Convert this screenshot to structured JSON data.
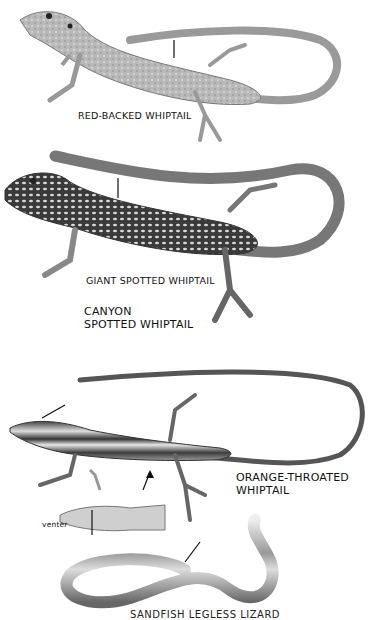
{
  "plate": {
    "background": "#ffffff",
    "labels": {
      "red_backed": "RED-BACKED WHIPTAIL",
      "giant_spotted": "GIANT SPOTTED WHIPTAIL",
      "canyon_line1": "CANYON",
      "canyon_line2": "SPOTTED WHIPTAIL",
      "orange_throated_line1": "ORANGE-THROATED",
      "orange_throated_line2": "WHIPTAIL",
      "venter": "venter",
      "bottom_cut": "SANDFISH LEGLESS LIZARD"
    },
    "illustrations": [
      {
        "name": "red-backed-whiptail",
        "style": "light gray stippled lizard, tail curling right"
      },
      {
        "name": "spotted-whiptail",
        "style": "dark lizard with pale spots, tail curling right"
      },
      {
        "name": "orange-throated-whiptail",
        "style": "striped lizard with long looping tail"
      },
      {
        "name": "venter-view",
        "style": "belly view of striped lizard"
      },
      {
        "name": "legless-lizard",
        "style": "striped legless lizard in figure-eight loop"
      }
    ]
  }
}
